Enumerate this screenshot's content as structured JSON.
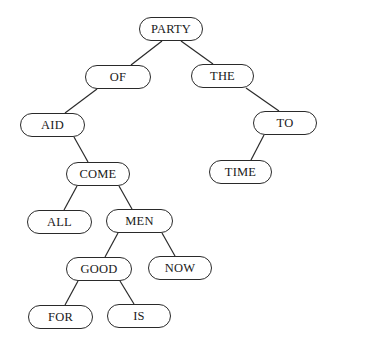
{
  "diagram": {
    "type": "binary-search-tree",
    "nodes": [
      {
        "id": "party",
        "label": "PARTY",
        "x": 139,
        "y": 17,
        "w": 64,
        "h": 24
      },
      {
        "id": "of",
        "label": "OF",
        "x": 85,
        "y": 65,
        "w": 66,
        "h": 24
      },
      {
        "id": "the",
        "label": "THE",
        "x": 191,
        "y": 64,
        "w": 63,
        "h": 24
      },
      {
        "id": "aid",
        "label": "AID",
        "x": 20,
        "y": 113,
        "w": 65,
        "h": 24
      },
      {
        "id": "to",
        "label": "TO",
        "x": 253,
        "y": 111,
        "w": 64,
        "h": 24
      },
      {
        "id": "come",
        "label": "COME",
        "x": 66,
        "y": 162,
        "w": 64,
        "h": 24
      },
      {
        "id": "time",
        "label": "TIME",
        "x": 209,
        "y": 160,
        "w": 63,
        "h": 24
      },
      {
        "id": "all",
        "label": "ALL",
        "x": 27,
        "y": 210,
        "w": 65,
        "h": 24
      },
      {
        "id": "men",
        "label": "MEN",
        "x": 106,
        "y": 209,
        "w": 67,
        "h": 24
      },
      {
        "id": "good",
        "label": "GOOD",
        "x": 66,
        "y": 257,
        "w": 66,
        "h": 24
      },
      {
        "id": "now",
        "label": "NOW",
        "x": 148,
        "y": 256,
        "w": 64,
        "h": 24
      },
      {
        "id": "for",
        "label": "FOR",
        "x": 28,
        "y": 305,
        "w": 65,
        "h": 24
      },
      {
        "id": "is",
        "label": "IS",
        "x": 107,
        "y": 304,
        "w": 64,
        "h": 24
      }
    ],
    "edges": [
      {
        "from": "party",
        "to": "of",
        "x1": 162,
        "y1": 41,
        "x2": 131,
        "y2": 65
      },
      {
        "from": "party",
        "to": "the",
        "x1": 181,
        "y1": 41,
        "x2": 213,
        "y2": 64
      },
      {
        "from": "of",
        "to": "aid",
        "x1": 97,
        "y1": 89,
        "x2": 65,
        "y2": 113
      },
      {
        "from": "the",
        "to": "to",
        "x1": 246,
        "y1": 88,
        "x2": 279,
        "y2": 111
      },
      {
        "from": "aid",
        "to": "come",
        "x1": 74,
        "y1": 137,
        "x2": 88,
        "y2": 162
      },
      {
        "from": "to",
        "to": "time",
        "x1": 264,
        "y1": 135,
        "x2": 251,
        "y2": 160
      },
      {
        "from": "come",
        "to": "all",
        "x1": 77,
        "y1": 186,
        "x2": 64,
        "y2": 210
      },
      {
        "from": "come",
        "to": "men",
        "x1": 119,
        "y1": 186,
        "x2": 132,
        "y2": 209
      },
      {
        "from": "men",
        "to": "good",
        "x1": 118,
        "y1": 233,
        "x2": 105,
        "y2": 257
      },
      {
        "from": "men",
        "to": "now",
        "x1": 162,
        "y1": 233,
        "x2": 175,
        "y2": 256
      },
      {
        "from": "good",
        "to": "for",
        "x1": 78,
        "y1": 281,
        "x2": 65,
        "y2": 305
      },
      {
        "from": "good",
        "to": "is",
        "x1": 120,
        "y1": 281,
        "x2": 134,
        "y2": 304
      }
    ]
  }
}
